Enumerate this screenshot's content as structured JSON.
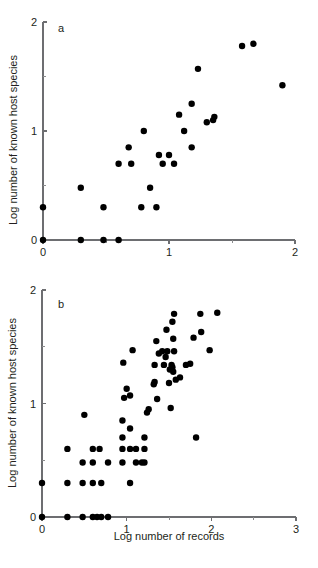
{
  "figure": {
    "title": "",
    "background_color": "#ffffff",
    "point_color": "#000000",
    "axis_color": "#6d6e71",
    "text_color": "#231f20"
  },
  "labels": {
    "panel_a": "a",
    "panel_b": "b",
    "ylabel": "Log number of known host species",
    "xlabel": "Log number of records"
  },
  "chart_data": [
    {
      "type": "scatter",
      "panel": "a",
      "title": "a",
      "xlabel": "",
      "ylabel": "Log number of known host species",
      "xlim": [
        0,
        2
      ],
      "ylim": [
        0,
        2
      ],
      "xticks": [
        0,
        1,
        2
      ],
      "xticklabels": [
        "0",
        "1",
        "2"
      ],
      "xminorticks": [
        0.5,
        1.5
      ],
      "yticks": [
        0,
        1,
        2
      ],
      "yticklabels": [
        "0",
        "1",
        "2"
      ],
      "yminorticks": [
        0.5,
        1.5
      ],
      "grid": false,
      "legend": null,
      "marker": "circle",
      "marker_size": 4,
      "points": [
        [
          0.0,
          0.0
        ],
        [
          0.3,
          0.0
        ],
        [
          0.48,
          0.0
        ],
        [
          0.6,
          0.0
        ],
        [
          0.0,
          0.3
        ],
        [
          0.48,
          0.3
        ],
        [
          0.78,
          0.3
        ],
        [
          0.9,
          0.3
        ],
        [
          0.3,
          0.48
        ],
        [
          0.85,
          0.48
        ],
        [
          0.6,
          0.7
        ],
        [
          0.7,
          0.7
        ],
        [
          0.95,
          0.7
        ],
        [
          1.04,
          0.7
        ],
        [
          0.92,
          0.78
        ],
        [
          1.0,
          0.78
        ],
        [
          0.68,
          0.85
        ],
        [
          1.18,
          0.85
        ],
        [
          0.8,
          1.0
        ],
        [
          1.12,
          1.0
        ],
        [
          1.3,
          1.08
        ],
        [
          1.35,
          1.1
        ],
        [
          1.36,
          1.13
        ],
        [
          1.08,
          1.15
        ],
        [
          1.18,
          1.25
        ],
        [
          1.23,
          1.57
        ],
        [
          1.9,
          1.42
        ],
        [
          1.58,
          1.78
        ],
        [
          1.67,
          1.8
        ]
      ],
      "n_points": 29
    },
    {
      "type": "scatter",
      "panel": "b",
      "title": "b",
      "xlabel": "Log number of records",
      "ylabel": "Log number of known host species",
      "xlim": [
        0,
        3
      ],
      "ylim": [
        0,
        2
      ],
      "xticks": [
        0,
        1,
        2,
        3
      ],
      "xticklabels": [
        "0",
        "1",
        "2",
        "3"
      ],
      "xminorticks": [
        0.5,
        1.5,
        2.5
      ],
      "yticks": [
        0,
        1,
        2
      ],
      "yticklabels": [
        "0",
        "1",
        "2"
      ],
      "yminorticks": [
        0.5,
        1.5
      ],
      "grid": false,
      "legend": null,
      "marker": "circle",
      "marker_size": 4,
      "points": [
        [
          0.0,
          0.0
        ],
        [
          0.3,
          0.0
        ],
        [
          0.48,
          0.0
        ],
        [
          0.6,
          0.0
        ],
        [
          0.65,
          0.0
        ],
        [
          0.7,
          0.0
        ],
        [
          0.78,
          0.0
        ],
        [
          0.0,
          0.3
        ],
        [
          0.3,
          0.3
        ],
        [
          0.48,
          0.3
        ],
        [
          0.6,
          0.3
        ],
        [
          0.7,
          0.3
        ],
        [
          1.04,
          0.3
        ],
        [
          0.48,
          0.48
        ],
        [
          0.6,
          0.48
        ],
        [
          0.78,
          0.48
        ],
        [
          0.95,
          0.48
        ],
        [
          1.11,
          0.48
        ],
        [
          1.18,
          0.48
        ],
        [
          1.21,
          0.48
        ],
        [
          0.3,
          0.6
        ],
        [
          0.6,
          0.6
        ],
        [
          0.68,
          0.6
        ],
        [
          0.95,
          0.6
        ],
        [
          1.04,
          0.6
        ],
        [
          1.11,
          0.6
        ],
        [
          1.21,
          0.6
        ],
        [
          0.95,
          0.7
        ],
        [
          1.21,
          0.7
        ],
        [
          1.82,
          0.7
        ],
        [
          1.04,
          0.78
        ],
        [
          0.95,
          0.85
        ],
        [
          0.5,
          0.9
        ],
        [
          1.24,
          0.92
        ],
        [
          1.26,
          0.95
        ],
        [
          1.52,
          0.96
        ],
        [
          0.97,
          1.05
        ],
        [
          1.04,
          1.07
        ],
        [
          1.36,
          1.04
        ],
        [
          1.0,
          1.13
        ],
        [
          1.32,
          1.17
        ],
        [
          1.33,
          1.19
        ],
        [
          1.5,
          1.18
        ],
        [
          1.58,
          1.21
        ],
        [
          1.63,
          1.23
        ],
        [
          1.55,
          1.28
        ],
        [
          1.51,
          1.3
        ],
        [
          1.54,
          1.32
        ],
        [
          0.96,
          1.36
        ],
        [
          1.33,
          1.34
        ],
        [
          1.44,
          1.34
        ],
        [
          1.53,
          1.34
        ],
        [
          1.7,
          1.34
        ],
        [
          1.75,
          1.35
        ],
        [
          1.46,
          1.41
        ],
        [
          1.07,
          1.47
        ],
        [
          1.38,
          1.44
        ],
        [
          1.42,
          1.46
        ],
        [
          1.48,
          1.46
        ],
        [
          1.56,
          1.46
        ],
        [
          1.98,
          1.47
        ],
        [
          1.35,
          1.55
        ],
        [
          1.55,
          1.57
        ],
        [
          1.79,
          1.58
        ],
        [
          1.88,
          1.63
        ],
        [
          1.47,
          1.65
        ],
        [
          1.54,
          1.72
        ],
        [
          1.56,
          1.79
        ],
        [
          1.87,
          1.79
        ],
        [
          2.07,
          1.8
        ]
      ],
      "n_points": 70
    }
  ]
}
